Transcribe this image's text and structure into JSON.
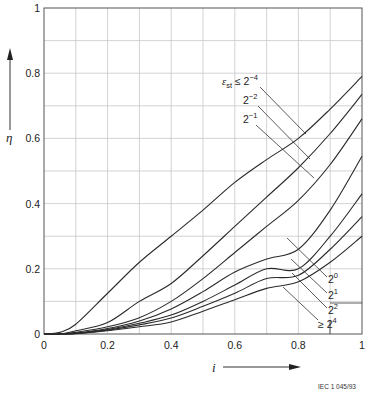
{
  "chart_data": {
    "type": "line",
    "title": "",
    "xlabel": "i",
    "ylabel": "η",
    "xlim": [
      0,
      1
    ],
    "ylim": [
      0,
      1
    ],
    "grid": true,
    "x_ticks": [
      "0",
      "0.2",
      "0.4",
      "0.6",
      "0.8",
      "1"
    ],
    "y_ticks": [
      "0",
      "0.2",
      "0.4",
      "0.6",
      "0.8",
      "1"
    ],
    "x": [
      0,
      0.05,
      0.1,
      0.2,
      0.3,
      0.4,
      0.5,
      0.6,
      0.7,
      0.8,
      0.9,
      1.0
    ],
    "series": [
      {
        "name": "ε_st ≤ 2^-4",
        "values": [
          0,
          0.005,
          0.03,
          0.125,
          0.22,
          0.3,
          0.38,
          0.465,
          0.535,
          0.6,
          0.69,
          0.79
        ]
      },
      {
        "name": "2^-2",
        "values": [
          0,
          0.0,
          0.01,
          0.035,
          0.1,
          0.155,
          0.24,
          0.33,
          0.42,
          0.51,
          0.615,
          0.735
        ]
      },
      {
        "name": "2^-1",
        "values": [
          0,
          0.0,
          0.005,
          0.022,
          0.05,
          0.1,
          0.17,
          0.25,
          0.33,
          0.41,
          0.52,
          0.66
        ]
      },
      {
        "name": "2^0",
        "values": [
          0,
          0.0,
          0.003,
          0.017,
          0.04,
          0.077,
          0.13,
          0.19,
          0.23,
          0.26,
          0.38,
          0.545
        ]
      },
      {
        "name": "2^1",
        "values": [
          0,
          0.0,
          0.002,
          0.014,
          0.033,
          0.058,
          0.1,
          0.15,
          0.2,
          0.2,
          0.3,
          0.43
        ]
      },
      {
        "name": "2^2",
        "values": [
          0,
          0.0,
          0.002,
          0.012,
          0.028,
          0.049,
          0.085,
          0.125,
          0.17,
          0.18,
          0.26,
          0.36
        ]
      },
      {
        "name": "≥ 2^4",
        "values": [
          0,
          0.0,
          0.001,
          0.01,
          0.022,
          0.037,
          0.07,
          0.105,
          0.14,
          0.16,
          0.22,
          0.3
        ]
      }
    ],
    "annotations": [
      "ε_st ≤ 2^-4",
      "2^-2",
      "2^-1",
      "2^0",
      "2^1",
      "2^2",
      "≥ 2^4"
    ],
    "footnote": "IEC 1 045/93"
  },
  "labels": {
    "y_axis": "η",
    "x_axis": "i",
    "footnote": "IEC 1 045/93",
    "upper": [
      {
        "base": "ε",
        "sub": "st",
        "rel": " ≤ 2",
        "exp": "−4"
      },
      {
        "base": "2",
        "exp": "−2"
      },
      {
        "base": "2",
        "exp": "−1"
      }
    ],
    "lower": [
      {
        "base": "2",
        "exp": "0"
      },
      {
        "base": "2",
        "exp": "1"
      },
      {
        "base": "2",
        "exp": "2"
      },
      {
        "prefix": "≥ ",
        "base": "2",
        "exp": "4"
      }
    ]
  },
  "colors": {
    "curve": "#2a2a2a",
    "grid": "#c8c8c8",
    "frame": "#555555",
    "text": "#222222"
  }
}
